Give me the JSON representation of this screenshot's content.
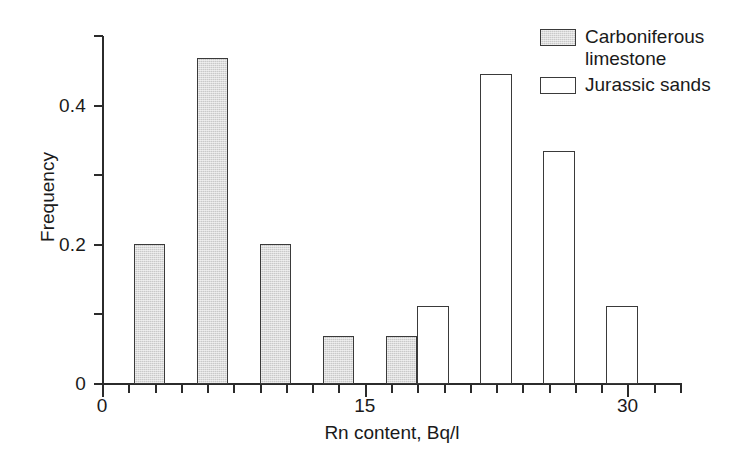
{
  "chart_data": {
    "type": "bar",
    "title": "",
    "subtitle": "",
    "xlabel": "Rn content, Bq/l",
    "ylabel": "Frequency",
    "xlim": [
      0,
      33
    ],
    "ylim": [
      0,
      0.5
    ],
    "grid": false,
    "legend_position": "top-right",
    "x_ticks_labeled": [
      {
        "value": 0,
        "label": "0"
      },
      {
        "value": 15,
        "label": "15"
      },
      {
        "value": 30,
        "label": "30"
      }
    ],
    "x_minor_tick_interval": 1.5,
    "y_ticks_labeled": [
      {
        "value": 0,
        "label": "0"
      },
      {
        "value": 0.2,
        "label": "0.2"
      },
      {
        "value": 0.4,
        "label": "0.4"
      }
    ],
    "y_minor_ticks": [
      0.1,
      0.3,
      0.5
    ],
    "bin_width": 1.8,
    "series": [
      {
        "name": "Carboniferous limestone",
        "fill": "#c9c9c9",
        "edge": "#3a3a3a",
        "bars": [
          {
            "x_left": 1.8,
            "value": 0.2
          },
          {
            "x_left": 5.4,
            "value": 0.467
          },
          {
            "x_left": 9.0,
            "value": 0.2
          },
          {
            "x_left": 12.6,
            "value": 0.067
          },
          {
            "x_left": 16.2,
            "value": 0.067
          }
        ]
      },
      {
        "name": "Jurassic sands",
        "fill": "#ffffff",
        "edge": "#3a3a3a",
        "bars": [
          {
            "x_left": 18.0,
            "value": 0.111
          },
          {
            "x_left": 21.6,
            "value": 0.444
          },
          {
            "x_left": 25.2,
            "value": 0.333
          },
          {
            "x_left": 28.8,
            "value": 0.111
          }
        ]
      }
    ]
  },
  "legend": {
    "items": [
      {
        "label_line1": "Carboniferous",
        "label_line2": "limestone",
        "swatch": "gray"
      },
      {
        "label_line1": "Jurassic sands",
        "label_line2": "",
        "swatch": "white"
      }
    ]
  },
  "axes": {
    "y_title": "Frequency",
    "x_title": "Rn content, Bq/l",
    "y_tick_labels": [
      "0",
      "0.2",
      "0.4"
    ],
    "x_tick_labels": [
      "0",
      "15",
      "30"
    ]
  }
}
